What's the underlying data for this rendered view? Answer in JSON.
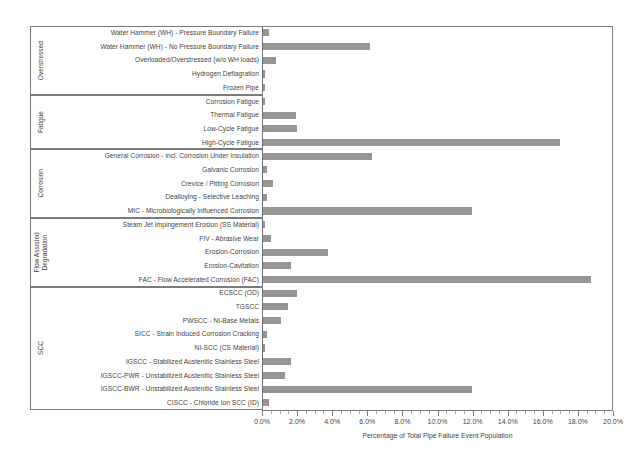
{
  "chart_data": {
    "type": "bar",
    "orientation": "horizontal",
    "title": "",
    "xlabel": "Percentage of Total Pipe Failure Event Population",
    "ylabel": "",
    "xlim": [
      0.0,
      20.0
    ],
    "xtick_labels": [
      "0.0%",
      "2.0%",
      "4.0%",
      "6.0%",
      "8.0%",
      "10.0%",
      "12.0%",
      "14.0%",
      "16.0%",
      "18.0%",
      "20.0%"
    ],
    "xtick_values": [
      0,
      2,
      4,
      6,
      8,
      10,
      12,
      14,
      16,
      18,
      20
    ],
    "minor_tick_interval": 0.5,
    "grid": false,
    "legend": null,
    "bar_color": "#969696",
    "axis_color": "#7a7a7a",
    "categories": [
      "Water Hammer (WH) - Pressure Boundary Failure",
      "Water Hammer (WH) - No Pressure Boundary Failure",
      "Overloaded/Overstressed (w/o WH loads)",
      "Hydrogen Deflagration",
      "Frozen Pipe",
      "Corrosion Fatigue",
      "Thermal Fatigue",
      "Low-Cycle Fatigue",
      "High-Cycle Fatigue",
      "General Corrosion - incl. Corrosion Under Insulation",
      "Galvanic Corrosion",
      "Crevice / Pitting Corrosion",
      "Dealloying - Selective Leaching",
      "MIC - Microbiologically Influenced Corrosion",
      "Steam Jet Impingement Erosion (SS Material)",
      "FIV - Abrasive Wear",
      "Erosion-Corrosion",
      "Erosion-Cavitation",
      "FAC - Flow Accelerated Corrosion (FAC)",
      "ECSCC (OD)",
      "TGSCC",
      "PWSCC - Ni-Base Metals",
      "SICC - Strain Induced Corrosion Cracking",
      "NI-SCC (CS Material)",
      "IGSCC - Stabilized Austenitic Stainless Steel",
      "IGSCC-PWR - Unstabilized Austenitic Stainless Steel",
      "IGSCC-BWR - Unstabilized Austenitic Stainless Steel",
      "CISCC - Chloride Ion SCC (ID)"
    ],
    "values": [
      0.35,
      6.1,
      0.75,
      0.1,
      0.08,
      0.12,
      1.9,
      1.95,
      16.9,
      6.2,
      0.2,
      0.58,
      0.25,
      11.9,
      0.05,
      0.45,
      3.7,
      1.6,
      18.7,
      1.95,
      1.45,
      1.05,
      0.2,
      0.05,
      1.6,
      1.25,
      11.9,
      0.35
    ],
    "groups": [
      {
        "label": "Overstressed",
        "start": 0,
        "count": 5
      },
      {
        "label": "Fatigue",
        "start": 5,
        "count": 4
      },
      {
        "label": "Corrosion",
        "start": 9,
        "count": 5
      },
      {
        "label": "Flow Assisted Degradation",
        "start": 14,
        "count": 5
      },
      {
        "label": "SCC",
        "start": 19,
        "count": 9
      }
    ]
  }
}
